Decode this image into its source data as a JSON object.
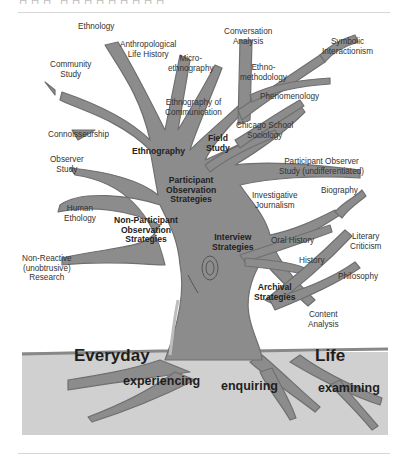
{
  "page": {
    "top_text_cut": "ㅁㅁㅁ  ㅁㅁㅁㅁㅁㅁㅁㅁㅁ"
  },
  "diagram": {
    "type": "tree-of-qualitative-research-methods",
    "colors": {
      "tree": "#8c8c8c",
      "tree_edge": "#6a6a6a",
      "ground": "#d0d0d0",
      "ground_line": "#888888",
      "text": "#333333"
    },
    "branch_labels": {
      "ethnology": "Ethnology",
      "anthropological_life_history": "Anthropological\nLife History",
      "community_study": "Community\nStudy",
      "micro_ethnography": "Micro-\nethnography",
      "ethnography_of_communication": "Ethnography of\nCommunication",
      "conversation_analysis": "Conversation\nAnalysis",
      "symbolic_interactionism": "Symbolic\nInteractionism",
      "ethnomethodology": "Ethno-\nmethodology",
      "phenomenology": "Phenomenology",
      "chicago_school_sociology": "Chicago School\nSociology",
      "participant_observer_study": "Participant Observer\nStudy (undifferentiated)",
      "connoisseurship": "Connoisseurship",
      "observer_study": "Observer\nStudy",
      "human_ethology": "Human\nEthology",
      "non_reactive_research": "Non-Reactive\n(unobtrusive)\nResearch",
      "investigative_journalism": "Investigative\nJournalism",
      "biography": "Biography",
      "oral_history": "Oral History",
      "literary_criticism": "Literary\nCriticism",
      "history": "History",
      "philosophy": "Philosophy",
      "content_analysis": "Content\nAnalysis"
    },
    "strategy_labels": {
      "ethnography": "Ethnography",
      "field_study": "Field\nStudy",
      "participant_observation": "Participant\nObservation\nStrategies",
      "non_participant_observation": "Non-Participant\nObservation\nStrategies",
      "interview": "Interview\nStrategies",
      "archival": "Archival\nStrategies"
    },
    "ground_labels": {
      "everyday": "Everyday",
      "life": "Life",
      "experiencing": "experiencing",
      "enquiring": "enquiring",
      "examining": "examining"
    }
  }
}
